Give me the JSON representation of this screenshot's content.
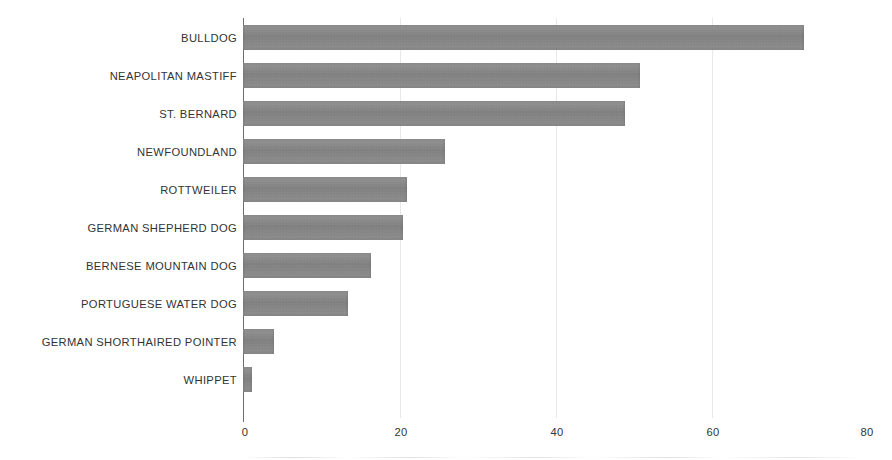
{
  "chart_data": {
    "type": "bar",
    "orientation": "horizontal",
    "title": "",
    "subtitle": "",
    "xlabel": "",
    "ylabel": "",
    "xlim": [
      0,
      80
    ],
    "ylim": null,
    "grid": false,
    "legend": null,
    "xticks": [
      0,
      20,
      40,
      60,
      80
    ],
    "xtick_labels": [
      "0",
      "20",
      "40",
      "60",
      "80"
    ],
    "categories": [
      "BULLDOG",
      "NEAPOLITAN MASTIFF",
      "ST. BERNARD",
      "NEWFOUNDLAND",
      "ROTTWEILER",
      "GERMAN SHEPHERD DOG",
      "BERNESE MOUNTAIN DOG",
      "PORTUGUESE WATER DOG",
      "GERMAN SHORTHAIRED POINTER",
      "WHIPPET"
    ],
    "values": [
      72,
      51,
      49,
      26,
      21,
      20.5,
      16.5,
      13.5,
      4,
      1.2
    ],
    "bars": [
      {
        "label": "BULLDOG",
        "value": 72
      },
      {
        "label": "NEAPOLITAN MASTIFF",
        "value": 51
      },
      {
        "label": "ST. BERNARD",
        "value": 49
      },
      {
        "label": "NEWFOUNDLAND",
        "value": 26
      },
      {
        "label": "ROTTWEILER",
        "value": 21
      },
      {
        "label": "GERMAN SHEPHERD DOG",
        "value": 20.5
      },
      {
        "label": "BERNESE MOUNTAIN DOG",
        "value": 16.5
      },
      {
        "label": "PORTUGUESE WATER DOG",
        "value": 13.5
      },
      {
        "label": "GERMAN SHORTHAIRED POINTER",
        "value": 4
      },
      {
        "label": "WHIPPET",
        "value": 1.2
      }
    ],
    "colors": {
      "bar": "#8a8a8a",
      "axis": "#6d6d6d",
      "text": "#333333",
      "background": "#ffffff"
    }
  }
}
